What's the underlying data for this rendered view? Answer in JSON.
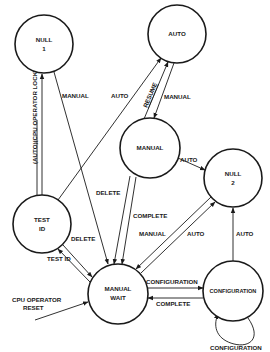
{
  "diagram": {
    "type": "state-transition",
    "nodes": [
      {
        "id": "null1",
        "lines": [
          "NULL",
          "1"
        ],
        "cx": 44,
        "cy": 44,
        "r": 29
      },
      {
        "id": "auto",
        "lines": [
          "AUTO"
        ],
        "cx": 177,
        "cy": 34,
        "r": 29
      },
      {
        "id": "manual",
        "lines": [
          "MANUAL"
        ],
        "cx": 150,
        "cy": 148,
        "r": 30
      },
      {
        "id": "null2",
        "lines": [
          "NULL",
          "2"
        ],
        "cx": 233,
        "cy": 178,
        "r": 29
      },
      {
        "id": "testid",
        "lines": [
          "TEST",
          "ID"
        ],
        "cx": 42,
        "cy": 224,
        "r": 29
      },
      {
        "id": "manualwait",
        "lines": [
          "MANUAL",
          "WAIT"
        ],
        "cx": 118,
        "cy": 294,
        "r": 30
      },
      {
        "id": "configuration",
        "lines": [
          "CONFIGURATION"
        ],
        "cx": 233,
        "cy": 291,
        "r": 30
      }
    ],
    "edges": [
      {
        "from": "testid",
        "to": "null1",
        "label": "(AUTO)(CPU OPERATOR LOCKOUT)"
      },
      {
        "from": "null1",
        "to": "manualwait",
        "label": "MANUAL"
      },
      {
        "from": "testid",
        "to": "auto",
        "label": "AUTO"
      },
      {
        "from": "manual",
        "to": "auto",
        "label": "RESUME"
      },
      {
        "from": "auto",
        "to": "manual",
        "label": "MANUAL"
      },
      {
        "from": "manual",
        "to": "null2",
        "label": "AUTO"
      },
      {
        "from": "manual",
        "to": "manualwait",
        "label": "DELETE"
      },
      {
        "from": "manual",
        "to": "manualwait",
        "label": "COMPLETE"
      },
      {
        "from": "null2",
        "to": "manualwait",
        "label": "MANUAL"
      },
      {
        "from": "manualwait",
        "to": "null2",
        "label": "AUTO"
      },
      {
        "from": "testid",
        "to": "manualwait",
        "label": "DELETE"
      },
      {
        "from": "manualwait",
        "to": "testid",
        "label": "TEST ID"
      },
      {
        "from": "manualwait",
        "to": "configuration",
        "label": "CONFIGURATION"
      },
      {
        "from": "configuration",
        "to": "manualwait",
        "label": "COMPLETE"
      },
      {
        "from": "configuration",
        "to": "null2",
        "label": "AUTO"
      },
      {
        "from": "configuration",
        "to": "configuration",
        "label": "CONFIGURATION"
      },
      {
        "from": "external",
        "to": "manualwait",
        "label": "CPU OPERATOR RESET"
      }
    ],
    "labels": {
      "null1_l1": "NULL",
      "null1_l2": "1",
      "auto": "AUTO",
      "manual": "MANUAL",
      "null2_l1": "NULL",
      "null2_l2": "2",
      "testid_l1": "TEST",
      "testid_l2": "ID",
      "manualwait_l1": "MANUAL",
      "manualwait_l2": "WAIT",
      "configuration": "CONFIGURATION",
      "e_lockout": "(AUTO)(CPU OPERATOR LOCKOUT)",
      "e_null1_manual": "MANUAL",
      "e_testid_auto": "AUTO",
      "e_resume": "RESUME",
      "e_auto_manual": "MANUAL",
      "e_manual_null2": "AUTO",
      "e_delete_manual": "DELETE",
      "e_complete_manual": "COMPLETE",
      "e_null2_manual": "MANUAL",
      "e_wait_null2_auto": "AUTO",
      "e_testid_delete": "DELETE",
      "e_testid": "TEST ID",
      "e_to_config": "CONFIGURATION",
      "e_config_complete": "COMPLETE",
      "e_config_auto": "AUTO",
      "e_config_self": "CONFIGURATION",
      "e_reset_l1": "CPU OPERATOR",
      "e_reset_l2": "RESET"
    }
  }
}
